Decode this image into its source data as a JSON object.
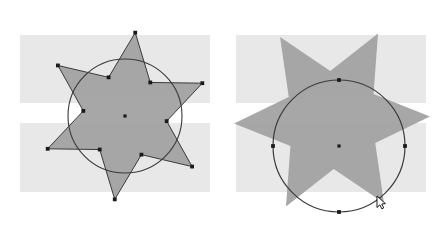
{
  "canvas": {
    "width": 441,
    "height": 225,
    "background_color": "#ffffff",
    "title": "Star and circle rotation illustration"
  },
  "colors": {
    "page_background": "#ffffff",
    "band_fill": "#e8e8e8",
    "shape_fill": "#a0a0a0",
    "outline_stroke": "#3a3a3a",
    "anchor_point": "#1a1a1a",
    "cursor_fill": "#ffffff",
    "cursor_stroke": "#000000"
  },
  "figure": {
    "panel_count": 2
  },
  "panels": [
    {
      "id": "panel-left",
      "name": "left-panel",
      "label": "",
      "bands": [
        {
          "x": 20,
          "y": 35,
          "width": 190,
          "height": 68
        },
        {
          "x": 20,
          "y": 123,
          "width": 190,
          "height": 69
        }
      ],
      "circle": {
        "cx": 125,
        "cy": 116,
        "r": 57
      },
      "center_marker": {
        "cx": 125,
        "cy": 116
      },
      "star": {
        "points": 6,
        "outer_radius": 84,
        "inner_radius": 42,
        "rotation_deg": -83,
        "cx": 125,
        "cy": 116,
        "anchors_visible": true,
        "anchor_count": 12
      },
      "cursor": null
    },
    {
      "id": "panel-right",
      "name": "right-panel",
      "label": "",
      "bands": [
        {
          "x": 236,
          "y": 35,
          "width": 190,
          "height": 68
        },
        {
          "x": 236,
          "y": 123,
          "width": 190,
          "height": 69
        }
      ],
      "circle": {
        "cx": 339,
        "cy": 146,
        "r": 66
      },
      "center_marker": {
        "cx": 339,
        "cy": 146
      },
      "star": {
        "points": 6,
        "outer_radius": 98,
        "inner_radius": 49,
        "rotation_deg": -62,
        "cx": 332,
        "cy": 120,
        "anchors_visible": false,
        "anchor_count": 0
      },
      "circle_anchors": [
        {
          "cx": 339,
          "cy": 80,
          "name": "anchor-top"
        },
        {
          "cx": 273,
          "cy": 146,
          "name": "anchor-left"
        },
        {
          "cx": 405,
          "cy": 146,
          "name": "anchor-right"
        },
        {
          "cx": 339,
          "cy": 212,
          "name": "anchor-bottom"
        }
      ],
      "cursor": {
        "x": 377,
        "y": 196,
        "kind": "arrow-pointer"
      }
    }
  ]
}
